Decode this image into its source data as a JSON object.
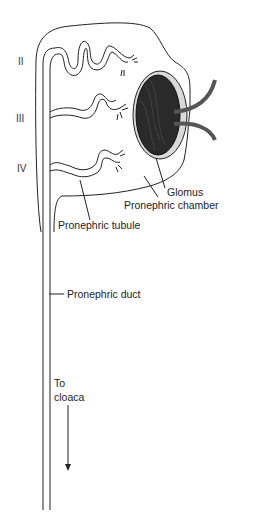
{
  "diagram": {
    "type": "anatomical-illustration",
    "segments": [
      {
        "label": "II"
      },
      {
        "label": "III"
      },
      {
        "label": "IV"
      }
    ],
    "labels": {
      "glomus": "Glomus",
      "chamber": "Pronephric chamber",
      "tubule": "Pronephric tubule",
      "duct": "Pronephric duct",
      "cloaca_line1": "To",
      "cloaca_line2": "cloaca"
    },
    "colors": {
      "line": "#222222",
      "glomus_fill": "#2a2a2a",
      "chamber_fill": "#d9d9d9",
      "vessel": "#555555"
    }
  }
}
